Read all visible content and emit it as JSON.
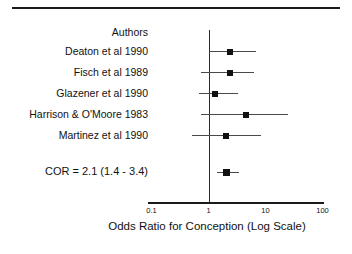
{
  "chart_data": {
    "type": "forest",
    "title": "",
    "xlabel": "Odds Ratio for Conception (Log Scale)",
    "ylabel": "",
    "column_header": "Authors",
    "scale": "log10",
    "xlim": [
      0.1,
      100
    ],
    "xticks": [
      0.1,
      1,
      10,
      100
    ],
    "xtick_labels": [
      "0.1",
      "1",
      "10",
      "100"
    ],
    "null_value": 1,
    "grid": false,
    "legend": "none",
    "studies": [
      {
        "label": "Deaton et al 1990",
        "or": 2.4,
        "ci_low": 1.0,
        "ci_high": 6.8
      },
      {
        "label": "Fisch et al  1989",
        "or": 2.4,
        "ci_low": 0.73,
        "ci_high": 6.3
      },
      {
        "label": "Glazener et al  1990",
        "or": 1.3,
        "ci_low": 0.67,
        "ci_high": 3.3
      },
      {
        "label": "Harrison & O'Moore 1983",
        "or": 4.5,
        "ci_low": 0.73,
        "ci_high": 25.0
      },
      {
        "label": "Martinez et al  1990",
        "or": 2.0,
        "ci_low": 0.52,
        "ci_high": 8.3
      }
    ],
    "summary": {
      "label": "COR = 2.1 (1.4 - 3.4)",
      "or": 2.1,
      "ci_low": 1.4,
      "ci_high": 3.4
    }
  }
}
